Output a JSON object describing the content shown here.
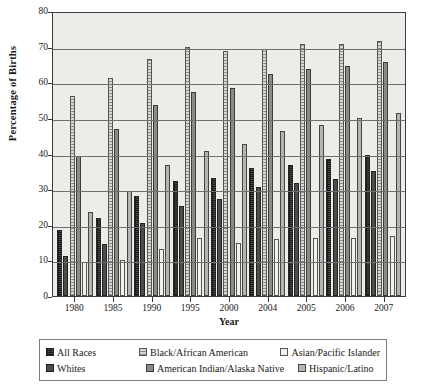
{
  "chart_data": {
    "type": "bar",
    "title": "",
    "xlabel": "Year",
    "ylabel": "Percentage of Births",
    "ylim": [
      0,
      80
    ],
    "yticks": [
      0,
      10,
      20,
      30,
      40,
      50,
      60,
      70,
      80
    ],
    "grid": true,
    "legend_position": "bottom",
    "categories": [
      "1980",
      "1985",
      "1990",
      "1995",
      "2000",
      "2004",
      "2005",
      "2006",
      "2007"
    ],
    "series": [
      {
        "name": "All Races",
        "values": [
          18.4,
          22.0,
          28.0,
          32.2,
          33.2,
          35.8,
          36.9,
          38.5,
          39.7
        ]
      },
      {
        "name": "Whites",
        "values": [
          11.2,
          14.5,
          20.4,
          25.3,
          27.1,
          30.5,
          31.7,
          32.9,
          35.0
        ]
      },
      {
        "name": "Black/African American",
        "values": [
          56.1,
          61.2,
          66.5,
          69.9,
          68.7,
          69.2,
          70.7,
          70.7,
          71.6
        ]
      },
      {
        "name": "American Indian/Alaska Native",
        "values": [
          39.2,
          46.8,
          53.6,
          57.2,
          58.4,
          62.3,
          63.7,
          64.6,
          65.8
        ]
      },
      {
        "name": "Asian/Pacific Islander",
        "values": [
          9.5,
          10.1,
          13.2,
          16.3,
          14.8,
          16.0,
          16.2,
          16.3,
          16.9
        ]
      },
      {
        "name": "Hispanic/Latino",
        "values": [
          23.6,
          29.5,
          36.7,
          40.8,
          42.7,
          46.4,
          48.0,
          49.9,
          51.3
        ]
      }
    ],
    "colors": {
      "all-races": "#4a4a4a",
      "whites": "#4c4c4c",
      "black-african-american": "#d8d8d4",
      "american-indian-alaska-native": "#8a8a86",
      "asian-pacific-islander": "#f2f1ee",
      "hispanic-latino": "#b4b4b0",
      "plot-background": "#edece8",
      "axis": "#3c3c3c",
      "gridline": "#6f6f6f"
    }
  },
  "legend": {
    "row1": [
      {
        "label": "All Races"
      },
      {
        "label": "Black/African American"
      },
      {
        "label": "Asian/Pacific Islander"
      }
    ],
    "row2": [
      {
        "label": "Whites"
      },
      {
        "label": "American Indian/Alaska Native"
      },
      {
        "label": "Hispanic/Latino"
      }
    ]
  }
}
